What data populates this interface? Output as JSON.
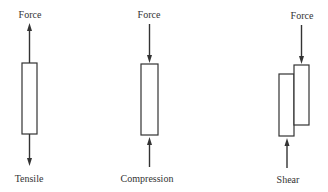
{
  "diagram": {
    "panels": [
      {
        "id": "tensile",
        "top_label": "Force",
        "bottom_label": "Tensile",
        "description": "Arrows point away from bar at both ends"
      },
      {
        "id": "compression",
        "top_label": "Force",
        "bottom_label": "Compression",
        "description": "Arrows point into bar at both ends"
      },
      {
        "id": "shear",
        "top_label": "Force",
        "bottom_label": "Shear",
        "description": "Two offset blocks; force down on right block, up on left block"
      }
    ],
    "colors": {
      "stroke": "#333333",
      "background": "#ffffff"
    }
  }
}
